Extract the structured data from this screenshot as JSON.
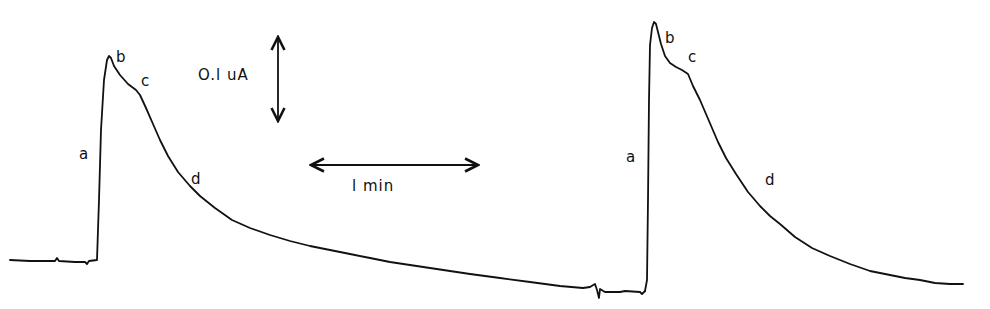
{
  "chart_data": {
    "type": "line",
    "title": "",
    "xlabel": "",
    "ylabel": "",
    "grid": false,
    "legend": null,
    "scale_bars": {
      "vertical": {
        "label": "0.1uA",
        "x": 278,
        "y_top": 37,
        "y_bottom": 121
      },
      "horizontal": {
        "label": "1 min",
        "x_left": 311,
        "x_right": 478,
        "y": 165
      }
    },
    "series": [
      {
        "name": "trace-1",
        "points": [
          [
            10,
            260
          ],
          [
            30,
            261
          ],
          [
            55,
            261
          ],
          [
            57,
            258
          ],
          [
            59,
            261
          ],
          [
            75,
            262
          ],
          [
            85,
            262
          ],
          [
            87,
            264
          ],
          [
            89,
            261
          ],
          [
            97,
            260
          ],
          [
            99,
            200
          ],
          [
            101,
            130
          ],
          [
            104,
            80
          ],
          [
            107,
            60
          ],
          [
            109,
            56
          ],
          [
            111,
            58
          ],
          [
            114,
            66
          ],
          [
            120,
            75
          ],
          [
            128,
            84
          ],
          [
            136,
            90
          ],
          [
            140,
            95
          ],
          [
            146,
            108
          ],
          [
            153,
            124
          ],
          [
            160,
            140
          ],
          [
            168,
            156
          ],
          [
            178,
            172
          ],
          [
            190,
            186
          ],
          [
            200,
            196
          ],
          [
            215,
            208
          ],
          [
            232,
            220
          ],
          [
            250,
            228
          ],
          [
            270,
            235
          ],
          [
            290,
            241
          ],
          [
            310,
            246
          ],
          [
            330,
            250
          ],
          [
            350,
            254
          ],
          [
            370,
            258
          ],
          [
            390,
            262
          ],
          [
            410,
            265
          ],
          [
            430,
            268
          ],
          [
            450,
            271
          ],
          [
            470,
            274
          ],
          [
            500,
            278
          ],
          [
            530,
            282
          ],
          [
            560,
            286
          ],
          [
            583,
            288
          ],
          [
            590,
            287
          ],
          [
            595,
            284
          ],
          [
            597,
            290
          ],
          [
            599,
            298
          ],
          [
            600,
            289
          ],
          [
            605,
            292
          ],
          [
            620,
            292
          ],
          [
            625,
            291
          ],
          [
            640,
            292
          ],
          [
            642,
            294
          ],
          [
            645,
            291
          ]
        ]
      },
      {
        "name": "trace-2",
        "points": [
          [
            645,
            291
          ],
          [
            647,
            280
          ],
          [
            648,
            200
          ],
          [
            649,
            100
          ],
          [
            650,
            45
          ],
          [
            652,
            28
          ],
          [
            654,
            22
          ],
          [
            656,
            24
          ],
          [
            658,
            32
          ],
          [
            661,
            44
          ],
          [
            665,
            56
          ],
          [
            670,
            63
          ],
          [
            676,
            67
          ],
          [
            682,
            70
          ],
          [
            688,
            74
          ],
          [
            693,
            86
          ],
          [
            700,
            100
          ],
          [
            706,
            114
          ],
          [
            712,
            128
          ],
          [
            718,
            142
          ],
          [
            726,
            158
          ],
          [
            736,
            174
          ],
          [
            748,
            192
          ],
          [
            760,
            206
          ],
          [
            770,
            216
          ],
          [
            780,
            224
          ],
          [
            795,
            237
          ],
          [
            812,
            248
          ],
          [
            830,
            256
          ],
          [
            850,
            264
          ],
          [
            870,
            271
          ],
          [
            890,
            275
          ],
          [
            905,
            278
          ],
          [
            920,
            280
          ],
          [
            935,
            283
          ],
          [
            950,
            284
          ],
          [
            963,
            284
          ]
        ]
      }
    ],
    "annotations": [
      {
        "text": "a",
        "trace": 1,
        "x": 79,
        "y": 147
      },
      {
        "text": "b",
        "trace": 1,
        "x": 116,
        "y": 50
      },
      {
        "text": "c",
        "trace": 1,
        "x": 141,
        "y": 74
      },
      {
        "text": "d",
        "trace": 1,
        "x": 191,
        "y": 172
      },
      {
        "text": "a",
        "trace": 2,
        "x": 626,
        "y": 150
      },
      {
        "text": "b",
        "trace": 2,
        "x": 665,
        "y": 31
      },
      {
        "text": "c",
        "trace": 2,
        "x": 688,
        "y": 50
      },
      {
        "text": "d",
        "trace": 2,
        "x": 765,
        "y": 173
      }
    ]
  },
  "labels": {
    "trace1": {
      "a": "a",
      "b": "b",
      "c": "c",
      "d": "d"
    },
    "trace2": {
      "a": "a",
      "b": "b",
      "c": "c",
      "d": "d"
    },
    "current_scale": "O.l uA",
    "time_scale": "l  min"
  },
  "colors": {
    "ink": "#111111",
    "background": "#ffffff"
  }
}
